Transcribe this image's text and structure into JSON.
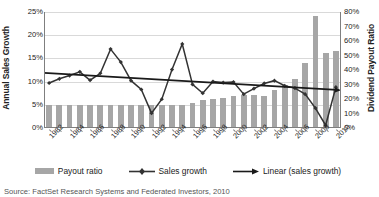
{
  "chart_data": {
    "type": "bar",
    "title": "",
    "xlabel": "",
    "ylabel": "Annual Sales Growth",
    "y2label": "Dividend Payout Ratio",
    "grid": true,
    "legend_position": "bottom",
    "ylim": [
      0,
      25
    ],
    "y2lim": [
      0,
      80
    ],
    "ytick_labels": [
      "0%",
      "5%",
      "10%",
      "15%",
      "20%",
      "25%"
    ],
    "ytick_values": [
      0,
      5,
      10,
      15,
      20,
      25
    ],
    "y2tick_labels": [
      "0%",
      "10%",
      "20%",
      "30%",
      "40%",
      "50%",
      "60%",
      "70%",
      "80%"
    ],
    "y2tick_values": [
      0,
      10,
      20,
      30,
      40,
      50,
      60,
      70,
      80
    ],
    "categories": [
      1982,
      1983,
      1984,
      1985,
      1986,
      1987,
      1988,
      1989,
      1990,
      1991,
      1992,
      1993,
      1994,
      1995,
      1996,
      1997,
      1998,
      1999,
      2000,
      2001,
      2002,
      2003,
      2004,
      2005,
      2006,
      2007,
      2008,
      2009,
      2010
    ],
    "xtick_labels": [
      "1982",
      "1984",
      "1986",
      "1988",
      "1990",
      "1992",
      "1994",
      "1996",
      "1998",
      "2000",
      "2002",
      "2004",
      "2006",
      "2008",
      "2010"
    ],
    "series": [
      {
        "name": "Payout ratio",
        "axis": "right",
        "kind": "bar",
        "color": "#a6a6a6",
        "values": [
          16,
          16,
          16,
          16,
          16,
          16,
          16,
          16,
          16,
          16,
          16,
          16,
          16,
          16,
          17,
          19,
          20,
          21,
          22,
          23,
          23,
          22,
          26,
          30,
          34,
          45,
          77,
          52,
          53
        ]
      },
      {
        "name": "Sales growth",
        "axis": "left",
        "kind": "line",
        "color": "#333333",
        "marker": "diamond",
        "values": [
          9.7,
          10.6,
          11.3,
          12.1,
          10.3,
          11.8,
          17.0,
          14.2,
          10.2,
          8.3,
          3.2,
          6.2,
          12.6,
          18.1,
          9.4,
          7.5,
          10.0,
          9.8,
          9.9,
          7.3,
          8.5,
          9.6,
          10.2,
          9.1,
          8.6,
          7.3,
          4.3,
          0.6,
          8.8
        ]
      },
      {
        "name": "Linear (sales growth)",
        "axis": "left",
        "kind": "trend",
        "color": "#1a1a1a",
        "endpoints": [
          11.9,
          8.2
        ]
      }
    ]
  },
  "axes": {
    "left_title": "Annual Sales Growth",
    "right_title": "Dividend Payout Ratio"
  },
  "legend": {
    "items": [
      {
        "label": "Payout ratio",
        "marker": "bar-swatch"
      },
      {
        "label": "Sales growth",
        "marker": "line-diamond"
      },
      {
        "label": "Linear (sales growth)",
        "marker": "line-arrow"
      }
    ]
  },
  "caption": {
    "text": "Source: FactSet Research Systems and Federated Investors, 2010"
  }
}
